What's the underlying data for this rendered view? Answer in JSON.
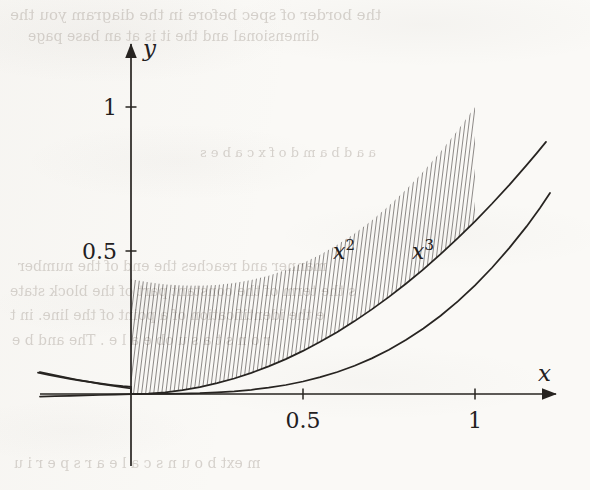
{
  "figure": {
    "caption_type": "cartesian-plot",
    "ink_color": "#272421",
    "paper_color": "#faf9f6",
    "axes": {
      "x_axis_label": "x",
      "y_axis_label": "y",
      "origin_px": [
        131,
        394
      ],
      "unit_px": {
        "x": 344,
        "y": 287
      },
      "x_ticks": [
        {
          "value": 0.5,
          "label": "0.5",
          "px": 303
        },
        {
          "value": 1,
          "label": "1",
          "px": 475
        }
      ],
      "y_ticks": [
        {
          "value": 0.5,
          "label": "0.5",
          "px": 251
        },
        {
          "value": 1,
          "label": "1",
          "px": 107
        }
      ],
      "x_axis_start_px": 40,
      "x_axis_arrow_px": 562,
      "y_axis_arrow_px": 38,
      "y_axis_bottom_px": 466
    },
    "curves": [
      {
        "name": "x-squared",
        "label": "x^2",
        "label_display": "x",
        "label_exponent": "2",
        "expression": "y = x^2",
        "label_px": [
          345,
          252
        ],
        "domain": [
          -0.27,
          1.14
        ]
      },
      {
        "name": "x-cubed",
        "label": "x^3",
        "label_display": "x",
        "label_exponent": "3",
        "expression": "y = x^3",
        "label_px": [
          424,
          252
        ],
        "domain": [
          -0.27,
          1.1
        ]
      }
    ],
    "shaded_region": {
      "name": "area-between-curves",
      "hatch_pattern": "vertical-line-hatch",
      "hatch_angle_deg": 83,
      "hatch_spacing_px": 4,
      "x_range": [
        0,
        1
      ],
      "upper_curve": "x-squared",
      "lower_curve": "x-cubed"
    }
  },
  "ghost_text": [
    {
      "text": "the border of spec before in the diagram you the",
      "px": [
        10,
        6
      ],
      "size": 15
    },
    {
      "text": "dimensional and the it is at an base page",
      "px": [
        28,
        28
      ],
      "size": 14
    },
    {
      "text": "a a  d  b  a  m  d o  f  x  c    a  b  e  s",
      "px": [
        200,
        145
      ],
      "size": 13
    },
    {
      "text": "manner and reaches the end of the number",
      "px": [
        18,
        258
      ],
      "size": 14
    },
    {
      "text": "s the term of the constant part of the block state",
      "px": [
        10,
        283
      ],
      "size": 14
    },
    {
      "text": "e the identification of a point of the line. in t",
      "px": [
        10,
        307
      ],
      "size": 14
    },
    {
      "text": "r o  n  s  t  a  s  u  ob  e  a  l  e .  The  and  b e",
      "px": [
        12,
        332
      ],
      "size": 14
    },
    {
      "text": "m  ext  b  o  u  n  s  c  a  l  e  a  r  s  p  e  r  i  u",
      "px": [
        14,
        455
      ],
      "size": 14
    }
  ]
}
